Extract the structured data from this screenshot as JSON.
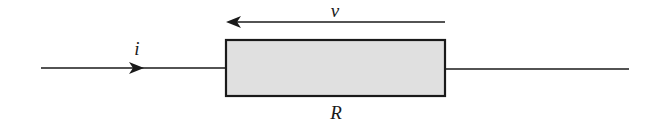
{
  "diagram": {
    "labels": {
      "current": "i",
      "voltage": "v",
      "resistor": "R"
    },
    "colors": {
      "stroke": "#1a1a1a",
      "resistor_fill": "#e0e0e0",
      "background": "#ffffff"
    },
    "elements": {
      "left_wire": {
        "x1": 41,
        "y1": 68,
        "x2": 225,
        "y2": 68
      },
      "right_wire": {
        "x1": 446,
        "y1": 69,
        "x2": 629,
        "y2": 69
      },
      "resistor": {
        "x": 225,
        "y": 40,
        "width": 221,
        "height": 57
      },
      "current_arrow": {
        "direction": "right",
        "tip_x": 143,
        "y": 68
      },
      "voltage_arrow": {
        "direction": "left",
        "x_start": 445,
        "x_end": 226,
        "y": 22
      }
    }
  }
}
